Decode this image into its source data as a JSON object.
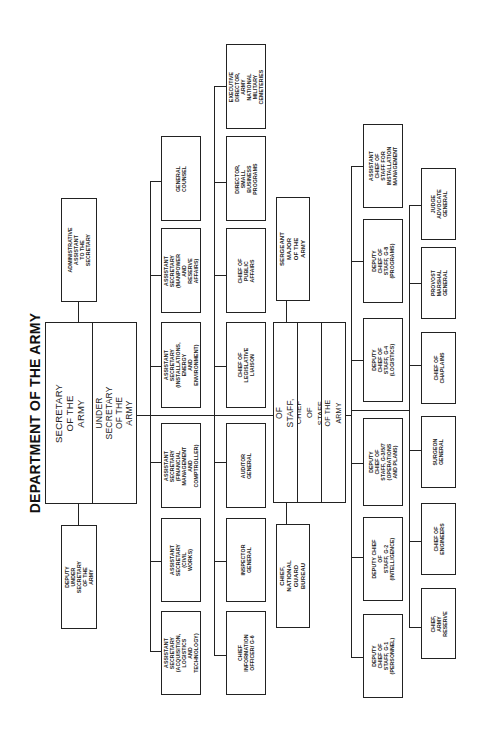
{
  "title": "DEPARTMENT OF THE ARMY",
  "secretariat": {
    "secretary": "SECRETARY OF THE ARMY",
    "under_secretary": "UNDER SECRETARY OF THE\nARMY",
    "admin_assistant": "ADMINISTRATIVE\nASSISTANT\nTO THE SECRETARY",
    "deputy_under_secretary": "DEPUTY UNDER SECRETARY\nOF THE ARMY"
  },
  "assistant_secretaries": [
    {
      "label": "GENERAL COUNSEL"
    },
    {
      "label": "ASSISTANT SECRETARY\n(MANPOWER AND\nRESERVE AFFAIRS)"
    },
    {
      "label": "ASSISTANT SECRETARY\n(INSTALLATIONS, ENERGY\nAND ENVIRONMENT)"
    },
    {
      "label": "ASSISTANT SECRETARY\n(FINANCIAL\nMANAGEMENT\nAND COMPTROLLER)"
    },
    {
      "label": "ASSISTANT SECRETARY\n(CIVIL WORKS)"
    },
    {
      "label": "ASSISTANT SECRETARY\n(ACQUISITION,\nLOGISTICS\nAND TECHNOLOGY)"
    }
  ],
  "secretariat_offices": [
    {
      "label": "EXECUTIVE DIRECTOR,\nARMY NATIONAL\nMILITARY CEMETERIES"
    },
    {
      "label": "DIRECTOR,\nSMALL BUSINESS\nPROGRAMS"
    },
    {
      "label": "CHIEF OF\nPUBLIC AFFAIRS"
    },
    {
      "label": "CHIEF OF\nLEGISLATIVE LIAISON"
    },
    {
      "label": "AUDITOR GENERAL"
    },
    {
      "label": "INSPECTOR GENERAL"
    },
    {
      "label": "CHIEF INFORMATION\nOFFICER/ G-6"
    }
  ],
  "army_staff": {
    "chief_of_staff": "CHIEF OF STAFF, ARMY",
    "vice_chief": "VICE CHIEF OF STAFF, ARMY",
    "director_army_staff": "DIRECTOR OF THE ARMY STAFF",
    "sergeant_major": "SERGEANT\nMAJOR\nOF THE ARMY",
    "national_guard": "CHIEF,\nNATIONAL\nGUARD BUREAU"
  },
  "deputy_chiefs": [
    {
      "label": "ASSISTANT CHIEF OF\nSTAFF FOR\nINSTALLATION\nMANAGEMENT"
    },
    {
      "label": "DEPUTY CHIEF OF\nSTAFF, G-8\n(PROGRAMS)"
    },
    {
      "label": "DEPUTY CHIEF OF\nSTAFF, G-4\n(LOGISTICS)"
    },
    {
      "label": "DEPUTY CHIEF OF\nSTAFF, G-3/5/7\n(OPERATIONS AND PLANS)"
    },
    {
      "label": "DEPUTY CHIEF OF\nSTAFF, G-2\n(INTELLIGENCE)"
    },
    {
      "label": "DEPUTY CHIEF OF\nSTAFF, G-1\n(PERSONNEL)"
    }
  ],
  "special_staff": [
    {
      "label": "JUDGE ADVOCATE\nGENERAL"
    },
    {
      "label": "PROVOST MARSHAL\nGENERAL"
    },
    {
      "label": "CHIEF OF\nCHAPLAINS"
    },
    {
      "label": "SURGEON\nGENERAL"
    },
    {
      "label": "CHIEF OF\nENGINEERS"
    },
    {
      "label": "CHIEF,\nARMY RESERVE"
    }
  ]
}
